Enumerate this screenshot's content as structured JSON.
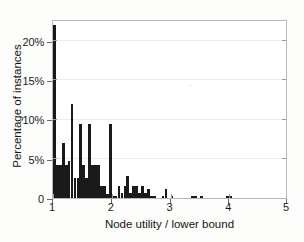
{
  "chart_data": {
    "type": "bar",
    "title": "",
    "subtitle": "",
    "xlabel": "Node utility / lower bound",
    "ylabel": "Percentage of instances",
    "xlim": [
      1,
      5
    ],
    "ylim": [
      0,
      22.8
    ],
    "grid": true,
    "legend": null,
    "legend_position": "none",
    "bar_color": "#1a1a1a",
    "bin_width": 0.05,
    "xticks": [
      1,
      2,
      3,
      4,
      5
    ],
    "xticklabels": [
      "1",
      "2",
      "3",
      "4",
      "5"
    ],
    "yticks": [
      0,
      5,
      10,
      15,
      20
    ],
    "yticklabels": [
      "0",
      "5%",
      "10%",
      "15%",
      "20%"
    ],
    "x": [
      1.0,
      1.05,
      1.1,
      1.15,
      1.2,
      1.25,
      1.3,
      1.35,
      1.4,
      1.45,
      1.5,
      1.55,
      1.6,
      1.65,
      1.7,
      1.75,
      1.8,
      1.85,
      1.9,
      1.95,
      2.0,
      2.05,
      2.1,
      2.15,
      2.2,
      2.25,
      2.3,
      2.35,
      2.4,
      2.45,
      2.5,
      2.55,
      2.6,
      2.65,
      2.7,
      2.75,
      2.8,
      2.85,
      2.9,
      2.95,
      3.0,
      3.05,
      3.1,
      3.15,
      3.2,
      3.25,
      3.3,
      3.35,
      3.4,
      3.45,
      3.5,
      3.55,
      3.6,
      3.65,
      3.7,
      3.75,
      3.8,
      3.85,
      3.9,
      3.95,
      4.0,
      4.05,
      4.1,
      4.2,
      4.4,
      4.6,
      4.8
    ],
    "values": [
      22.0,
      4.2,
      4.2,
      7.0,
      4.2,
      4.7,
      12.0,
      2.6,
      2.6,
      9.4,
      4.2,
      2.6,
      9.4,
      4.2,
      4.2,
      4.2,
      1.5,
      1.5,
      0.5,
      9.4,
      0.3,
      0.3,
      1.5,
      0.6,
      1.5,
      2.8,
      0.6,
      1.5,
      1.5,
      0.6,
      1.5,
      0.6,
      1.1,
      0.3,
      0.3,
      0.0,
      0.0,
      0.3,
      1.1,
      0.0,
      0.3,
      0.0,
      0.0,
      0.0,
      0.0,
      0.0,
      0.0,
      0.2,
      0.3,
      0.0,
      0.3,
      0.0,
      0.0,
      0.0,
      0.0,
      0.0,
      0.0,
      0.0,
      0.0,
      0.3,
      0.3,
      0.0,
      0.0,
      0.0,
      0.0,
      0.0,
      0.0
    ]
  }
}
